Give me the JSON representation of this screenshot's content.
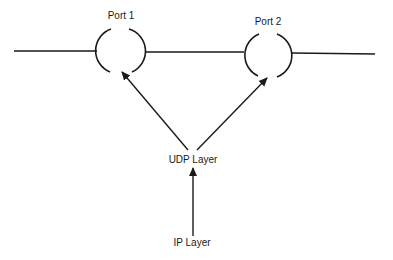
{
  "diagram": {
    "ports": [
      {
        "label": "Port 1"
      },
      {
        "label": "Port 2"
      }
    ],
    "layers": {
      "udp": "UDP Layer",
      "ip": "IP Layer"
    },
    "colors": {
      "stroke": "#1a1a1a",
      "background": "#ffffff"
    }
  }
}
